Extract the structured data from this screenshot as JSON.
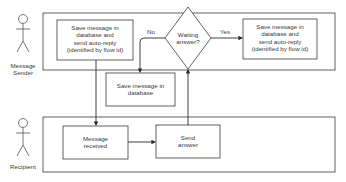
{
  "actors": {
    "sender": "Message\nSender",
    "sender_line1": "Message",
    "sender_line2": "Sender",
    "recipient": "Recipient"
  },
  "nodes": {
    "save_autoreply_left": [
      "Save message in",
      "database and",
      "send auto-reply",
      "(identified by flow id)"
    ],
    "decision": [
      "Waiting",
      "answer?"
    ],
    "save_autoreply_right": [
      "Save message in",
      "database and",
      "send auto-reply",
      "(identified by flow id)"
    ],
    "save_db": [
      "Save message in",
      "database"
    ],
    "message_received": [
      "Message",
      "received"
    ],
    "send_answer": [
      "Send",
      "answer"
    ]
  },
  "edges": {
    "no_label": "No",
    "yes_label": "Yes"
  },
  "colors": {
    "stroke": "#3a3a3a",
    "background": "#ffffff"
  }
}
